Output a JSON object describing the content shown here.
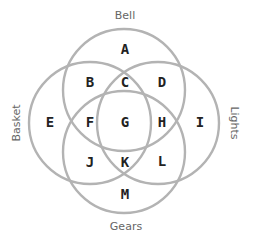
{
  "diagram": {
    "type": "venn-4-set",
    "colors": {
      "circle_stroke": "#b3b3b3",
      "region_text": "#222222",
      "set_label_text": "#666666"
    },
    "sets": [
      {
        "name": "Bell",
        "position": "top"
      },
      {
        "name": "Basket",
        "position": "left"
      },
      {
        "name": "Lights",
        "position": "right"
      },
      {
        "name": "Gears",
        "position": "bottom"
      }
    ],
    "regions": {
      "A": "A",
      "B": "B",
      "C": "C",
      "D": "D",
      "E": "E",
      "F": "F",
      "G": "G",
      "H": "H",
      "I": "I",
      "J": "J",
      "K": "K",
      "L": "L",
      "M": "M"
    }
  }
}
